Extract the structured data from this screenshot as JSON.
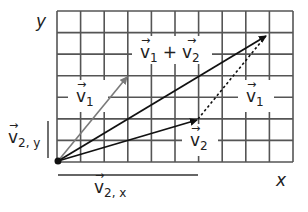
{
  "axes": {
    "x_label": "x",
    "y_label": "y"
  },
  "grid": {
    "columns": 10,
    "rows": 7,
    "line_color": "#555555"
  },
  "vectors": {
    "v1": {
      "label": "v",
      "sub": "1",
      "from": [
        0,
        0
      ],
      "to": [
        3,
        4
      ],
      "color": "#7a7a7a"
    },
    "v2": {
      "label": "v",
      "sub": "2",
      "from": [
        0,
        0
      ],
      "to": [
        6,
        2
      ],
      "color": "#111111"
    },
    "sum": {
      "label": "v",
      "sub1": "1",
      "op": "+",
      "label2": "v",
      "sub2": "2",
      "from": [
        0,
        0
      ],
      "to": [
        9,
        6
      ],
      "color": "#111111"
    },
    "v1_shifted": {
      "label": "v",
      "sub": "1",
      "from": [
        6,
        2
      ],
      "to": [
        9,
        6
      ],
      "style": "dashed",
      "color": "#111111"
    }
  },
  "components": {
    "v2x": {
      "label": "v",
      "sub": "2, x"
    },
    "v2y": {
      "label": "v",
      "sub": "2, y"
    }
  }
}
